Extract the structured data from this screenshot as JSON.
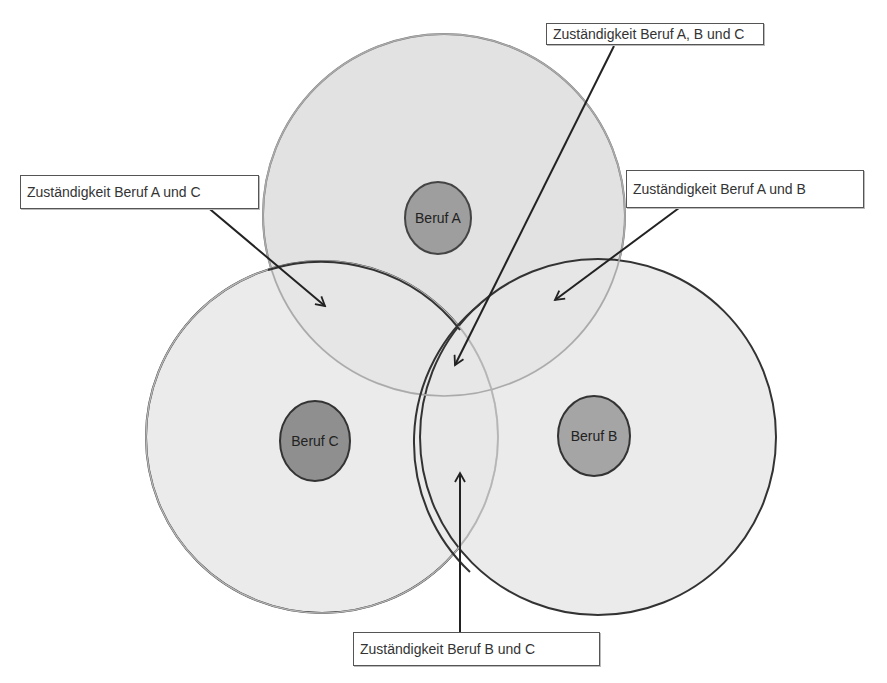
{
  "diagram": {
    "type": "venn",
    "colors": {
      "background": "#ffffff",
      "outer_fill": "#e4e4e4",
      "outer_stroke_dark": "#333333",
      "outer_stroke_a": "#777777",
      "inner_fill": "#9a9a9a",
      "inner_stroke": "#333333",
      "arrow": "#222222",
      "label_border": "#555555",
      "label_text": "#333333"
    },
    "circles": [
      {
        "id": "A",
        "label": "Beruf A"
      },
      {
        "id": "B",
        "label": "Beruf B"
      },
      {
        "id": "C",
        "label": "Beruf C"
      }
    ],
    "callouts": [
      {
        "id": "abc",
        "text": "Zuständigkeit Beruf A, B und C"
      },
      {
        "id": "ac",
        "text": "Zuständigkeit Beruf A und C"
      },
      {
        "id": "ab",
        "text": "Zuständigkeit Beruf A und B"
      },
      {
        "id": "bc",
        "text": "Zuständigkeit Beruf B und C"
      }
    ]
  }
}
